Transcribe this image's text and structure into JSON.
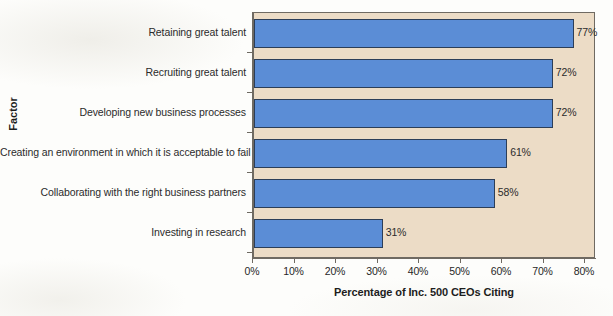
{
  "chart_data": {
    "type": "bar",
    "orientation": "horizontal",
    "title": "",
    "xlabel": "Percentage of Inc. 500 CEOs Citing",
    "ylabel": "Factor",
    "categories": [
      "Retaining great talent",
      "Recruiting great talent",
      "Developing new business processes",
      "Creating an environment in which it is acceptable to fail",
      "Collaborating with the right business partners",
      "Investing in research"
    ],
    "values": [
      77,
      72,
      72,
      61,
      58,
      31
    ],
    "value_labels": [
      "77%",
      "72%",
      "72%",
      "61%",
      "58%",
      "31%"
    ],
    "xlim": [
      0,
      80
    ],
    "xticks": [
      0,
      10,
      20,
      30,
      40,
      50,
      60,
      70,
      80
    ],
    "xtick_labels": [
      "0%",
      "10%",
      "20%",
      "30%",
      "40%",
      "50%",
      "60%",
      "70%",
      "80%"
    ],
    "grid": false,
    "legend": null,
    "bar_color": "#5b8dd6",
    "bar_border_color": "#2c3e58",
    "plot_background": "#ecdcc6",
    "axis_color": "#6f6a62",
    "figure_background": "#fdfdfb"
  },
  "axis": {
    "x_title": "Percentage of Inc. 500 CEOs Citing",
    "y_title": "Factor"
  }
}
